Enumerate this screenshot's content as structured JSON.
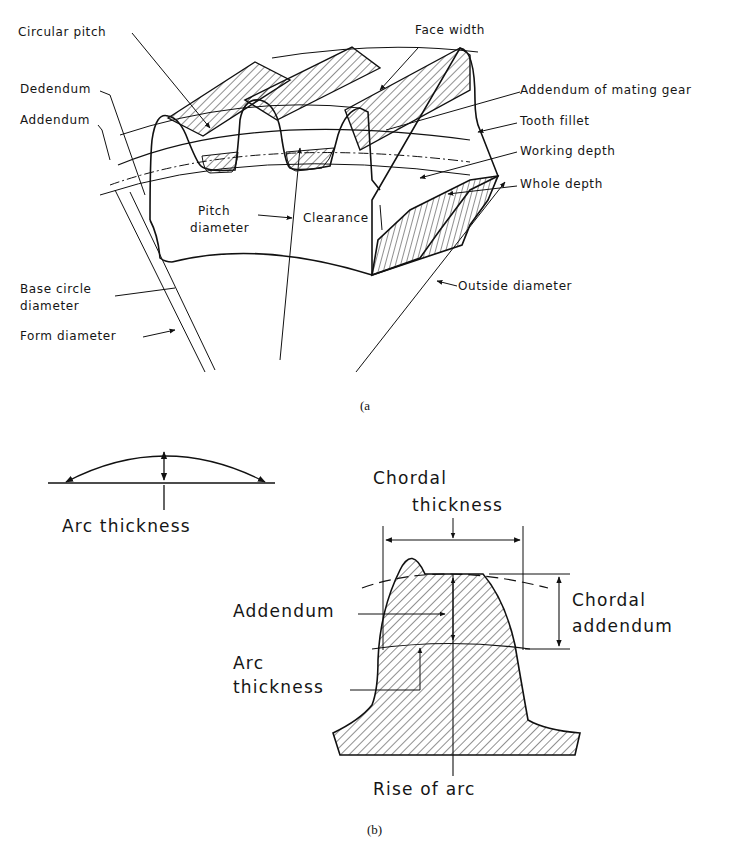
{
  "figure_a": {
    "caption": "(a",
    "labels": {
      "circular_pitch": "Circular pitch",
      "face_width": "Face width",
      "dedendum": "Dedendum",
      "addendum": "Addendum",
      "addendum_mating_gear": "Addendum of mating gear",
      "tooth_fillet": "Tooth fillet",
      "working_depth": "Working depth",
      "whole_depth": "Whole depth",
      "pitch_diameter_1": "Pitch",
      "pitch_diameter_2": "diameter",
      "clearance": "Clearance",
      "base_circle_1": "Base circle",
      "base_circle_2": "diameter",
      "form_diameter": "Form diameter",
      "outside_diameter": "Outside diameter"
    }
  },
  "figure_b": {
    "caption": "(b)",
    "labels": {
      "arc_thickness_top": "Arc thickness",
      "chordal_thickness_1": "Chordal",
      "chordal_thickness_2": "thickness",
      "addendum": "Addendum",
      "arc_thickness_1": "Arc",
      "arc_thickness_2": "thickness",
      "chordal_addendum_1": "Chordal",
      "chordal_addendum_2": "addendum",
      "rise_of_arc": "Rise of arc"
    }
  }
}
